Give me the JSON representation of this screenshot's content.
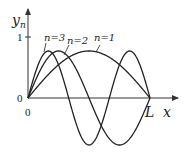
{
  "diagram": {
    "axes": {
      "y_label": "y",
      "y_subscript": "n",
      "x_label": "x",
      "origin_label": "0",
      "y_tick_zero": "0",
      "y_tick_one": "1",
      "x_end_label": "L"
    },
    "curves": [
      {
        "label": "n=1",
        "n": 1
      },
      {
        "label": "n=2",
        "n": 2
      },
      {
        "label": "n=3",
        "n": 3
      }
    ],
    "colors": {
      "line": "#222222",
      "axis": "#333333"
    }
  }
}
